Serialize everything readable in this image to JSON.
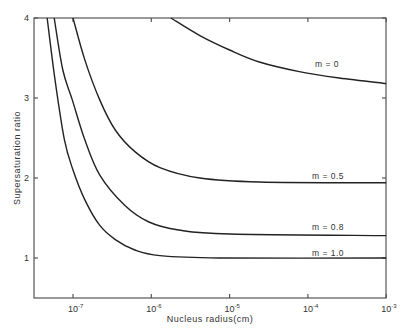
{
  "chart_data": {
    "type": "line",
    "title": "",
    "xlabel": "Nucleus radius(cm)",
    "ylabel": "Supersaturation ratio",
    "x_scale": "log",
    "xlim_log10": [
      -7.5,
      -3
    ],
    "ylim": [
      0.5,
      4
    ],
    "x_ticks": [
      {
        "log": -7,
        "label": "10",
        "exp": "-7"
      },
      {
        "log": -6,
        "label": "10",
        "exp": "-6"
      },
      {
        "log": -5,
        "label": "10",
        "exp": "-5"
      },
      {
        "log": -4,
        "label": "10",
        "exp": "-4"
      },
      {
        "log": -3,
        "label": "10",
        "exp": "-3"
      }
    ],
    "y_ticks": [
      1,
      2,
      3,
      4
    ],
    "grid": false,
    "legend": "inline curve labels at right",
    "series": [
      {
        "name": "m = 0",
        "label_pos": [
          315,
          67
        ],
        "points_log10r_S": [
          [
            -5.75,
            4.0
          ],
          [
            -5.38,
            3.78
          ],
          [
            -5.0,
            3.6
          ],
          [
            -4.62,
            3.45
          ],
          [
            -4.11,
            3.33
          ],
          [
            -3.6,
            3.25
          ],
          [
            -3.0,
            3.18
          ]
        ]
      },
      {
        "name": "m = 0.5",
        "label_pos": [
          312,
          179
        ],
        "points_log10r_S": [
          [
            -7.0,
            4.0
          ],
          [
            -6.85,
            3.48
          ],
          [
            -6.66,
            2.98
          ],
          [
            -6.46,
            2.6
          ],
          [
            -6.21,
            2.33
          ],
          [
            -5.89,
            2.13
          ],
          [
            -5.38,
            2.0
          ],
          [
            -4.62,
            1.95
          ],
          [
            -3.0,
            1.94
          ]
        ]
      },
      {
        "name": "m = 0.8",
        "label_pos": [
          312,
          230
        ],
        "points_log10r_S": [
          [
            -7.24,
            4.0
          ],
          [
            -7.13,
            3.35
          ],
          [
            -7.01,
            2.98
          ],
          [
            -6.85,
            2.48
          ],
          [
            -6.66,
            2.04
          ],
          [
            -6.34,
            1.66
          ],
          [
            -6.03,
            1.45
          ],
          [
            -5.65,
            1.35
          ],
          [
            -5.0,
            1.3
          ],
          [
            -3.0,
            1.28
          ]
        ]
      },
      {
        "name": "m = 1.0",
        "label_pos": [
          312,
          256
        ],
        "points_log10r_S": [
          [
            -7.33,
            4.0
          ],
          [
            -7.23,
            3.23
          ],
          [
            -7.11,
            2.48
          ],
          [
            -7.0,
            2.1
          ],
          [
            -6.85,
            1.73
          ],
          [
            -6.66,
            1.41
          ],
          [
            -6.46,
            1.23
          ],
          [
            -6.21,
            1.1
          ],
          [
            -5.89,
            1.03
          ],
          [
            -5.13,
            1.0
          ],
          [
            -3.0,
            1.0
          ]
        ]
      }
    ]
  }
}
